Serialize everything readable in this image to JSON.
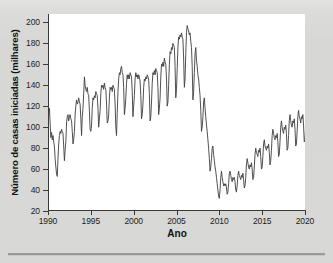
{
  "figure": {
    "ylabel": "Número de casas iniciadas (milhares)",
    "xlabel": "Ano",
    "line_color": "#3d3d3d",
    "plot_background": "#ffffff",
    "page_background": "#d8d8d6"
  },
  "chart_data": {
    "type": "line",
    "title": "",
    "xlabel": "Ano",
    "ylabel": "Número de casas iniciadas (milhares)",
    "xlim": [
      1990.0,
      2020.0
    ],
    "ylim": [
      20,
      208
    ],
    "grid": false,
    "legend": null,
    "x_tick_labels": [
      "1990",
      "1995",
      "2000",
      "2005",
      "2010",
      "2015",
      "2020"
    ],
    "x_ticks": [
      1990,
      1995,
      2000,
      2005,
      2010,
      2015,
      2020
    ],
    "y_tick_labels": [
      "20",
      "40",
      "60",
      "80",
      "100",
      "120",
      "140",
      "160",
      "180",
      "200"
    ],
    "y_ticks": [
      20,
      40,
      60,
      80,
      100,
      120,
      140,
      160,
      180,
      200
    ],
    "series": [
      {
        "name": "Casas iniciadas (mensal)",
        "x_start": 1990.0,
        "x_step": 0.08333,
        "values": [
          120,
          112,
          118,
          104,
          90,
          95,
          88,
          92,
          86,
          82,
          70,
          62,
          55,
          53,
          70,
          84,
          92,
          96,
          94,
          98,
          96,
          94,
          82,
          68,
          78,
          86,
          104,
          110,
          112,
          106,
          110,
          112,
          108,
          106,
          96,
          84,
          88,
          96,
          112,
          120,
          126,
          122,
          124,
          128,
          124,
          122,
          108,
          92,
          110,
          118,
          132,
          148,
          140,
          136,
          134,
          138,
          132,
          130,
          116,
          98,
          96,
          102,
          118,
          128,
          126,
          130,
          128,
          134,
          132,
          130,
          118,
          100,
          108,
          116,
          132,
          140,
          138,
          140,
          136,
          142,
          138,
          136,
          122,
          104,
          106,
          112,
          128,
          138,
          136,
          138,
          134,
          140,
          138,
          136,
          122,
          100,
          92,
          114,
          134,
          146,
          152,
          150,
          156,
          158,
          152,
          150,
          138,
          112,
          118,
          128,
          142,
          150,
          146,
          150,
          146,
          152,
          150,
          148,
          134,
          110,
          120,
          130,
          146,
          152,
          148,
          150,
          146,
          150,
          148,
          144,
          130,
          108,
          112,
          122,
          138,
          146,
          144,
          148,
          146,
          150,
          148,
          146,
          132,
          106,
          110,
          124,
          142,
          152,
          150,
          154,
          150,
          156,
          154,
          152,
          138,
          112,
          118,
          128,
          148,
          160,
          158,
          162,
          158,
          166,
          162,
          160,
          146,
          120,
          124,
          140,
          160,
          172,
          170,
          176,
          174,
          180,
          178,
          176,
          158,
          128,
          136,
          156,
          176,
          186,
          184,
          188,
          186,
          190,
          186,
          184,
          166,
          138,
          146,
          170,
          190,
          197,
          194,
          192,
          188,
          190,
          182,
          176,
          158,
          126,
          134,
          152,
          170,
          176,
          164,
          158,
          150,
          146,
          138,
          130,
          116,
          96,
          100,
          110,
          124,
          128,
          118,
          110,
          102,
          96,
          88,
          80,
          70,
          58,
          62,
          70,
          80,
          82,
          74,
          68,
          62,
          58,
          52,
          46,
          40,
          34,
          32,
          40,
          52,
          58,
          52,
          48,
          44,
          46,
          44,
          46,
          42,
          36,
          38,
          46,
          56,
          58,
          54,
          50,
          48,
          52,
          50,
          52,
          48,
          40,
          38,
          44,
          54,
          58,
          54,
          52,
          50,
          54,
          52,
          56,
          50,
          42,
          44,
          52,
          64,
          70,
          66,
          62,
          60,
          64,
          62,
          66,
          60,
          50,
          52,
          62,
          74,
          80,
          76,
          74,
          72,
          78,
          76,
          80,
          72,
          60,
          62,
          72,
          84,
          88,
          82,
          80,
          78,
          82,
          80,
          84,
          76,
          64,
          68,
          78,
          92,
          98,
          94,
          90,
          88,
          92,
          90,
          94,
          86,
          72,
          74,
          86,
          100,
          106,
          100,
          96,
          94,
          100,
          98,
          102,
          94,
          78,
          80,
          92,
          106,
          112,
          106,
          102,
          100,
          106,
          104,
          108,
          98,
          82,
          84,
          96,
          110,
          116,
          110,
          108,
          104,
          110,
          108,
          112,
          102,
          86,
          88,
          100,
          114,
          120,
          114,
          110,
          108,
          114,
          112,
          116,
          106,
          92,
          96,
          108,
          118,
          112,
          104,
          98,
          116
        ]
      }
    ],
    "annotations": [
      {
        "text": "pico 2005-2006",
        "approx_value": 197
      },
      {
        "text": "vale 2009-2011",
        "approx_value": 32
      },
      {
        "text": "vale 1991",
        "approx_value": 53
      }
    ]
  }
}
